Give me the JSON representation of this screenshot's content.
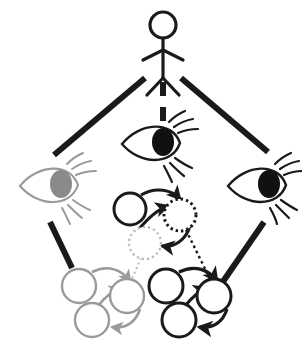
{
  "figure": {
    "background_color": "#ffffff",
    "canvas": {
      "width": 302,
      "height": 347
    }
  },
  "colors": {
    "black": "#1a1a1a",
    "dark": "#222222",
    "gray": "#9a9a9a",
    "light_gray": "#bcbcbc",
    "pupil_gray": "#8a8a8a",
    "white": "#ffffff"
  },
  "actor": {
    "name": "stick-figure",
    "label": "",
    "head": {
      "cx": 163,
      "cy": 25,
      "r": 13
    },
    "stroke_color": "#1a1a1a",
    "stroke_width": 3
  },
  "eyes": [
    {
      "id": "eye-left",
      "label": "",
      "position": {
        "cx": 58,
        "cy": 186
      },
      "color": "#9a9a9a",
      "pupil_color": "#8a8a8a",
      "pupil_filled": true,
      "lash_side": "right"
    },
    {
      "id": "eye-center",
      "label": "",
      "position": {
        "cx": 160,
        "cy": 144
      },
      "color": "#1a1a1a",
      "pupil_color": "#111111",
      "pupil_filled": true,
      "lash_side": "right"
    },
    {
      "id": "eye-right",
      "label": "",
      "position": {
        "cx": 266,
        "cy": 186
      },
      "color": "#1a1a1a",
      "pupil_color": "#111111",
      "pupil_filled": true,
      "lash_side": "right"
    }
  ],
  "actor_links": [
    {
      "id": "link-actor-to-eye-left",
      "style": "solid",
      "color": "#1a1a1a",
      "width": 6,
      "from": "stick-figure",
      "to": "eye-left"
    },
    {
      "id": "link-actor-to-eye-center",
      "style": "dashed",
      "color": "#1a1a1a",
      "width": 6,
      "from": "stick-figure",
      "to": "eye-center"
    },
    {
      "id": "link-actor-to-eye-right",
      "style": "solid",
      "color": "#1a1a1a",
      "width": 6,
      "from": "stick-figure",
      "to": "eye-right"
    }
  ],
  "eye_links": [
    {
      "id": "link-eye-left-to-cluster-gray",
      "style": "solid",
      "color": "#1a1a1a",
      "width": 6,
      "from": "eye-left",
      "to": "cluster-bottom-left"
    },
    {
      "id": "link-eye-right-to-cluster-black",
      "style": "solid",
      "color": "#1a1a1a",
      "width": 6,
      "from": "eye-right",
      "to": "cluster-bottom-right"
    }
  ],
  "cluster_links": [
    {
      "id": "link-node-gray-dotted-to-cluster-gray",
      "style": "dotted",
      "color": "#bcbcbc",
      "width": 2,
      "from": "node-mid-gray-dotted",
      "to": "cluster-bottom-left"
    },
    {
      "id": "link-node-black-dotted-to-cluster-black",
      "style": "dotted",
      "color": "#1a1a1a",
      "width": 2.4,
      "from": "node-mid-black-dotted",
      "to": "cluster-bottom-right"
    }
  ],
  "clusters": [
    {
      "id": "cluster-middle",
      "label": "",
      "nodes": [
        {
          "id": "node-mid-solid-black",
          "cx": 130,
          "cy": 209,
          "r": 16,
          "stroke": "#1a1a1a",
          "style": "solid",
          "fill": "#ffffff"
        },
        {
          "id": "node-mid-black-dotted",
          "cx": 180,
          "cy": 215,
          "r": 16,
          "stroke": "#1a1a1a",
          "style": "dotted",
          "fill": "#ffffff"
        },
        {
          "id": "node-mid-gray-dotted",
          "cx": 145,
          "cy": 243,
          "r": 16,
          "stroke": "#bcbcbc",
          "style": "dotted",
          "fill": "#ffffff"
        }
      ],
      "arrows": [
        {
          "id": "arrow-mid-1",
          "color": "#1a1a1a"
        },
        {
          "id": "arrow-mid-2",
          "color": "#1a1a1a"
        },
        {
          "id": "arrow-mid-3",
          "color": "#1a1a1a"
        }
      ]
    },
    {
      "id": "cluster-bottom-left",
      "label": "",
      "color": "#9a9a9a",
      "nodes": [
        {
          "id": "node-bl-1",
          "cx": 79,
          "cy": 286,
          "r": 17
        },
        {
          "id": "node-bl-2",
          "cx": 127,
          "cy": 296,
          "r": 17
        },
        {
          "id": "node-bl-3",
          "cx": 92,
          "cy": 320,
          "r": 17
        }
      ],
      "arrows": [
        {
          "id": "arrow-bl-1",
          "color": "#9a9a9a"
        },
        {
          "id": "arrow-bl-2",
          "color": "#9a9a9a"
        },
        {
          "id": "arrow-bl-3",
          "color": "#9a9a9a"
        }
      ]
    },
    {
      "id": "cluster-bottom-right",
      "label": "",
      "color": "#1a1a1a",
      "nodes": [
        {
          "id": "node-br-1",
          "cx": 166,
          "cy": 286,
          "r": 17
        },
        {
          "id": "node-br-2",
          "cx": 214,
          "cy": 296,
          "r": 17
        },
        {
          "id": "node-br-3",
          "cx": 179,
          "cy": 320,
          "r": 17
        }
      ],
      "arrows": [
        {
          "id": "arrow-br-1",
          "color": "#1a1a1a"
        },
        {
          "id": "arrow-br-2",
          "color": "#1a1a1a"
        },
        {
          "id": "arrow-br-3",
          "color": "#1a1a1a"
        }
      ]
    }
  ]
}
